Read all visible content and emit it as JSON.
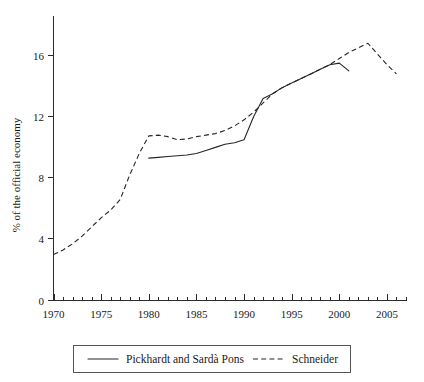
{
  "chart_data": {
    "type": "line",
    "title": "",
    "xlabel": "",
    "ylabel": "% of the official economy",
    "xlim": [
      1970,
      2007
    ],
    "ylim": [
      0,
      18
    ],
    "grid": false,
    "legend_position": "bottom",
    "y_ticks": [
      0,
      4,
      8,
      12,
      16
    ],
    "y_tick_labels": [
      "0",
      "4",
      "8",
      "12",
      "16"
    ],
    "x_ticks": [
      1970,
      1975,
      1980,
      1985,
      1990,
      1995,
      2000,
      2005
    ],
    "x_tick_labels": [
      "1970",
      "1975",
      "1980",
      "1985",
      "1990",
      "1995",
      "2000",
      "2005"
    ],
    "x_minor_tick_step": 1,
    "series": [
      {
        "name": "Pickhardt and Sardà Pons",
        "style": "solid",
        "color": "#262626",
        "x": [
          1980,
          1981,
          1982,
          1983,
          1984,
          1985,
          1986,
          1987,
          1988,
          1989,
          1990,
          1991,
          1992,
          1993,
          1994,
          1995,
          1996,
          1997,
          1998,
          1999,
          2000,
          2001
        ],
        "values": [
          9.3,
          9.35,
          9.4,
          9.45,
          9.5,
          9.6,
          9.8,
          10.0,
          10.2,
          10.3,
          10.5,
          12.0,
          13.2,
          13.5,
          13.9,
          14.2,
          14.5,
          14.8,
          15.1,
          15.4,
          15.5,
          15.0
        ]
      },
      {
        "name": "Schneider",
        "style": "dashed",
        "color": "#262626",
        "x": [
          1970,
          1971,
          1972,
          1973,
          1974,
          1975,
          1976,
          1977,
          1978,
          1979,
          1980,
          1981,
          1982,
          1983,
          1984,
          1985,
          1986,
          1987,
          1988,
          1989,
          1990,
          1991,
          1992,
          1993,
          1994,
          1995,
          1996,
          1997,
          1998,
          1999,
          2000,
          2001,
          2002,
          2003,
          2004,
          2005,
          2006
        ],
        "values": [
          3.0,
          3.3,
          3.7,
          4.2,
          4.8,
          5.4,
          5.9,
          6.6,
          8.2,
          9.6,
          10.75,
          10.8,
          10.7,
          10.5,
          10.55,
          10.7,
          10.8,
          10.9,
          11.1,
          11.4,
          11.8,
          12.3,
          12.9,
          13.5,
          13.9,
          14.2,
          14.5,
          14.8,
          15.1,
          15.4,
          15.8,
          16.2,
          16.5,
          16.8,
          16.1,
          15.4,
          14.8
        ]
      }
    ]
  },
  "legend": {
    "entries": [
      {
        "label": "Pickhardt and Sardà Pons",
        "style": "solid"
      },
      {
        "label": "Schneider",
        "style": "dashed"
      }
    ]
  }
}
